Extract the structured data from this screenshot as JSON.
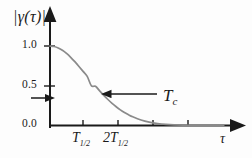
{
  "figure": {
    "background_color": "#fdfdfd",
    "axis_color": "#1a1a1a",
    "curve_color": "#8a8a8a"
  },
  "axes": {
    "y_label": "|γ(τ)|",
    "x_label": "τ",
    "y_ticks": [
      {
        "label": "1.0",
        "value": 1.0
      },
      {
        "label": "0.5",
        "value": 0.5
      },
      {
        "label": "0.0",
        "value": 0.0
      }
    ],
    "x_ticks": [
      {
        "label_main": "T",
        "label_sub": "1/2",
        "value": 1
      },
      {
        "label_main": "2T",
        "label_sub": "1/2",
        "value": 2
      }
    ]
  },
  "annotations": {
    "coherence_time": {
      "label_main": "T",
      "label_sub": "c",
      "arrow_direction": "left",
      "points_to_x": 1.0,
      "points_to_y": 0.37
    },
    "level_marker": {
      "arrow_direction": "right",
      "value": 0.37,
      "description": "1/e level marker on vertical axis"
    }
  },
  "chart_data": {
    "type": "line",
    "title": "",
    "xlabel": "τ",
    "ylabel": "|γ(τ)|",
    "xlim": [
      0,
      4.4
    ],
    "ylim": [
      0,
      1.12
    ],
    "grid": false,
    "legend": "none",
    "series": [
      {
        "name": "|γ(τ)|",
        "color": "#8a8a8a",
        "x": [
          0.0,
          0.1,
          0.2,
          0.3,
          0.4,
          0.5,
          0.6,
          0.7,
          0.8,
          0.9,
          1.0,
          1.1,
          1.2,
          1.3,
          1.4,
          1.5,
          1.6,
          1.7,
          1.8,
          1.9,
          2.0,
          2.2,
          2.4,
          2.6,
          2.8,
          3.0,
          3.4,
          3.8,
          4.2
        ],
        "y": [
          1.0,
          0.994,
          0.976,
          0.946,
          0.906,
          0.858,
          0.803,
          0.743,
          0.681,
          0.618,
          0.5,
          0.494,
          0.435,
          0.379,
          0.327,
          0.279,
          0.236,
          0.197,
          0.163,
          0.134,
          0.109,
          0.069,
          0.042,
          0.025,
          0.014,
          0.008,
          0.002,
          0.001,
          0.0
        ]
      }
    ]
  }
}
